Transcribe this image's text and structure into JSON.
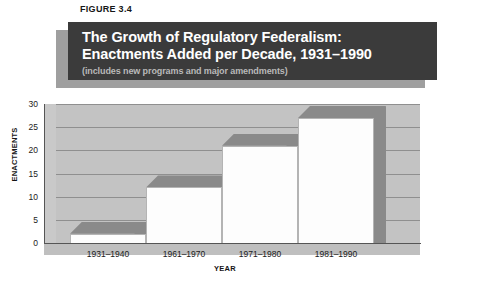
{
  "figure": {
    "number_label": "FIGURE 3.4",
    "title_line1": "The Growth of Regulatory Federalism:",
    "title_line2": "Enactments Added per Decade, 1931–1990",
    "subtitle": "(includes new programs and major amendments)"
  },
  "colors": {
    "banner_bg": "#3b3b3b",
    "banner_shadow": "#9f9f9f",
    "banner_text": "#ffffff",
    "banner_subtitle_text": "#b9b9b9",
    "plot_bg": "#c3c3c3",
    "gridline": "#8f8f8f",
    "bar_front": "#fdfdfd",
    "bar_top": "#8a8a8a",
    "bar_side": "#8a8a8a",
    "axis": "#555555"
  },
  "chart_data": {
    "type": "bar",
    "title": "The Growth of Regulatory Federalism: Enactments Added per Decade, 1931–1990",
    "subtitle": "(includes new programs and major amendments)",
    "xlabel": "YEAR",
    "ylabel": "ENACTMENTS",
    "categories": [
      "1931–1940",
      "1961–1970",
      "1971–1980",
      "1981–1990"
    ],
    "values": [
      2,
      12,
      21,
      27
    ],
    "ylim": [
      0,
      30
    ],
    "ytick_labels": [
      "0",
      "5",
      "10",
      "15",
      "20",
      "25",
      "30"
    ],
    "ytick_values": [
      0,
      5,
      10,
      15,
      20,
      25,
      30
    ],
    "grid": true,
    "legend": "none",
    "style": "3d-bar",
    "annotations": []
  }
}
